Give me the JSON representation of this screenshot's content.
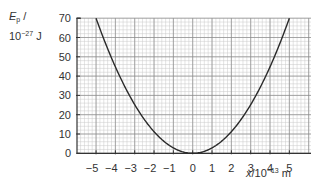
{
  "chart_data": {
    "type": "line",
    "title": "",
    "xlabel": "x/10^-13 m",
    "ylabel": "E_p / 10^-27 J",
    "xlabel_parts": {
      "var": "x",
      "unit_prefix": "/10",
      "exp": "−13",
      "unit": " m"
    },
    "ylabel_parts": {
      "var": "E",
      "sub": "p",
      "slash": " /",
      "prefix": "10",
      "exp": "−27",
      "unit": " J"
    },
    "xlim": [
      -6,
      6.1
    ],
    "ylim": [
      0,
      70
    ],
    "xticks": [
      -5,
      -4,
      -3,
      -2,
      -1,
      0,
      1,
      2,
      3,
      4,
      5
    ],
    "xtick_labels": [
      "−5",
      "−4",
      "−3",
      "−2",
      "−1",
      "0",
      "1",
      "2",
      "3",
      "4",
      "5"
    ],
    "yticks": [
      0,
      10,
      20,
      30,
      40,
      50,
      60,
      70
    ],
    "ytick_labels": [
      "0",
      "10",
      "20",
      "30",
      "40",
      "50",
      "60",
      "70"
    ],
    "grid": {
      "major": true,
      "minor": true,
      "minor_per_major": 5
    },
    "legend": null,
    "series": [
      {
        "name": "E_p",
        "color": "#2a2a2a",
        "formula": "E = 2.8 x^2",
        "x": [
          -5,
          -4.5,
          -4,
          -3.5,
          -3,
          -2.5,
          -2,
          -1.5,
          -1,
          -0.5,
          0,
          0.5,
          1,
          1.5,
          2,
          2.5,
          3,
          3.5,
          4,
          4.5,
          5
        ],
        "y": [
          70,
          56.7,
          44.8,
          34.3,
          25.2,
          17.5,
          11.2,
          6.3,
          2.8,
          0.7,
          0,
          0.7,
          2.8,
          6.3,
          11.2,
          17.5,
          25.2,
          34.3,
          44.8,
          56.7,
          70
        ]
      }
    ]
  }
}
